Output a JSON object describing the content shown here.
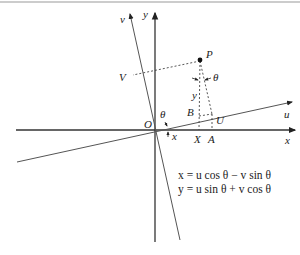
{
  "diagram": {
    "labels": {
      "x_axis": "x",
      "y_axis": "y",
      "u_axis": "u",
      "v_axis": "v",
      "origin": "O",
      "point_P": "P",
      "point_V": "V",
      "point_B": "B",
      "point_U": "U",
      "point_X": "X",
      "point_A": "A",
      "theta_origin": "θ",
      "theta_P": "θ",
      "seg_x": "x",
      "seg_y": "y"
    },
    "equations": [
      "x = u cos θ − v sin θ",
      "y = u sin θ + v cos θ"
    ],
    "colors": {
      "axis": "#333333",
      "rotated_axis": "#555555",
      "dotted": "#444444",
      "border": "#bbbbbb"
    }
  }
}
